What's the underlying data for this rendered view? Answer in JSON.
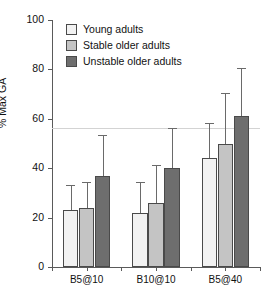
{
  "chart_data": {
    "type": "bar",
    "title": "",
    "subtitle": "",
    "xlabel": "",
    "ylabel": "% Max GA",
    "ylim": [
      0,
      100
    ],
    "yticks": [
      0,
      20,
      40,
      60,
      80,
      100
    ],
    "ytick_labels": [
      "0",
      "20",
      "40",
      "60",
      "80",
      "100"
    ],
    "grid": false,
    "legend_position": "top-left",
    "reference_line": 56,
    "categories": [
      "B5@10",
      "B10@10",
      "B5@40"
    ],
    "series": [
      {
        "name": "Young adults",
        "color": "#f2f2f2",
        "values": [
          23,
          22,
          44
        ],
        "err_upper": [
          33,
          34,
          58
        ]
      },
      {
        "name": "Stable older adults",
        "color": "#c4c4c4",
        "values": [
          24,
          26,
          50
        ],
        "err_upper": [
          34,
          41,
          70
        ]
      },
      {
        "name": "Unstable older adults",
        "color": "#6e6e6e",
        "values": [
          37,
          40,
          61
        ],
        "err_upper": [
          53,
          56,
          80
        ]
      }
    ]
  },
  "axis": {
    "y_title": "% Max GA"
  },
  "legend": {
    "items": [
      {
        "label": "Young adults"
      },
      {
        "label": "Stable older adults"
      },
      {
        "label": "Unstable older adults"
      }
    ]
  }
}
